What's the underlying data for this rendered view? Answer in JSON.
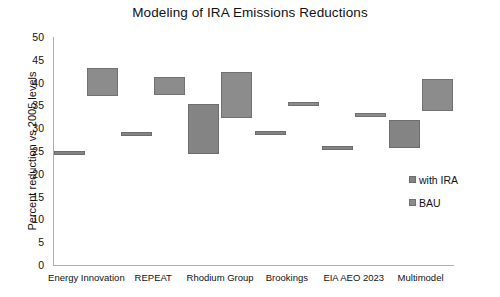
{
  "chart_data": {
    "type": "bar",
    "title": "Modeling of IRA Emissions Reductions",
    "xlabel": "",
    "ylabel": "Percent reduction vs 2005 levels",
    "ylim": [
      0,
      50
    ],
    "ytick_step": 5,
    "yticks": [
      "50",
      "45",
      "40",
      "35",
      "30",
      "25",
      "20",
      "15",
      "10",
      "5",
      "0"
    ],
    "grid": false,
    "legend_position": "right",
    "note": "Floating range bars: each entry has a low and high bound on the y axis.",
    "categories": [
      "Energy Innovation",
      "REPEAT",
      "Rhodium Group",
      "Brookings",
      "EIA AEO 2023",
      "Multimodel"
    ],
    "series": [
      {
        "name": "with IRA",
        "color": "#848484",
        "ranges": [
          {
            "low": 24.2,
            "high": 25.0
          },
          {
            "low": 28.5,
            "high": 29.1
          },
          {
            "low": 24.3,
            "high": 35.3
          },
          {
            "low": 28.7,
            "high": 29.3
          },
          {
            "low": 25.7,
            "high": 26.2
          },
          {
            "low": 25.7,
            "high": 31.8
          }
        ]
      },
      {
        "name": "BAU",
        "color": "#8c8c8c",
        "ranges": [
          {
            "low": 37.1,
            "high": 43.1
          },
          {
            "low": 37.3,
            "high": 41.2
          },
          {
            "low": 32.3,
            "high": 42.3
          },
          {
            "low": 35.2,
            "high": 35.8
          },
          {
            "low": 32.8,
            "high": 33.4
          },
          {
            "low": 33.8,
            "high": 40.7
          }
        ]
      }
    ]
  }
}
